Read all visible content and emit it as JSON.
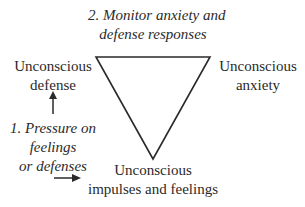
{
  "diagram": {
    "top_label": [
      "2. Monitor anxiety and",
      "defense responses"
    ],
    "nodes": {
      "defense": [
        "Unconscious",
        "defense"
      ],
      "anxiety": [
        "Unconscious",
        "anxiety"
      ],
      "impulses": [
        "Unconscious",
        "impulses and feelings"
      ]
    },
    "pressure_label": [
      "1. Pressure on",
      "feelings",
      "or defenses"
    ],
    "shape": "inverted-triangle",
    "line_color": "#2a2a2a"
  }
}
